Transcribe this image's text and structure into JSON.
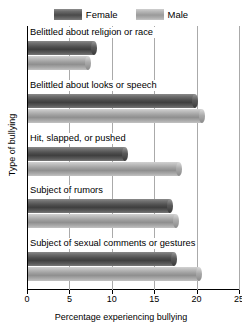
{
  "chart_data": {
    "type": "bar",
    "orientation": "horizontal",
    "title": "",
    "xlabel": "Percentage experiencing bullying",
    "ylabel": "Type of bullying",
    "xlim": [
      0,
      25
    ],
    "xticks": [
      0,
      5,
      10,
      15,
      20,
      25
    ],
    "grid": true,
    "legend_position": "top",
    "categories": [
      "Belittled about religion or race",
      "Belittled about looks or speech",
      "Hit, slapped, or pushed",
      "Subject of rumors",
      "Subject of sexual comments or gestures"
    ],
    "series": [
      {
        "name": "Female",
        "color": "#4f4f4f",
        "values": [
          7.8,
          19.7,
          11.4,
          16.7,
          17.2
        ]
      },
      {
        "name": "Male",
        "color": "#a0a0a0",
        "values": [
          7.1,
          20.5,
          17.8,
          17.4,
          20.2
        ]
      }
    ]
  },
  "legend": {
    "entries": [
      {
        "label": "Female",
        "swatch": "female-swatch"
      },
      {
        "label": "Male",
        "swatch": "male-swatch"
      }
    ]
  }
}
